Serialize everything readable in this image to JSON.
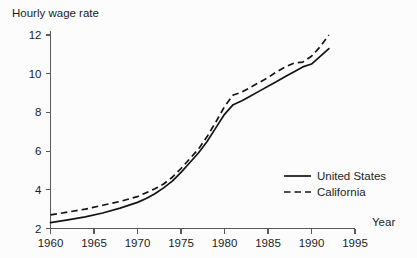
{
  "chart_data": {
    "type": "line",
    "title": "Hourly wage rate",
    "xlabel": "Year",
    "ylabel": "Hourly wage rate",
    "xlim": [
      1960,
      1995
    ],
    "ylim": [
      2,
      12
    ],
    "grid": false,
    "legend_position": "right-middle",
    "xticks": [
      1960,
      1965,
      1970,
      1975,
      1980,
      1985,
      1990,
      1995
    ],
    "yticks": [
      2,
      4,
      6,
      8,
      10,
      12
    ],
    "xtick_labels": [
      "1960",
      "1965",
      "1970",
      "1975",
      "1980",
      "1985",
      "1990",
      "1995"
    ],
    "ytick_labels": [
      "2",
      "4",
      "6",
      "8",
      "10",
      "12"
    ],
    "x": [
      1960,
      1962,
      1964,
      1966,
      1968,
      1970,
      1971,
      1972,
      1973,
      1974,
      1975,
      1976,
      1977,
      1978,
      1979,
      1980,
      1981,
      1982,
      1983,
      1984,
      1985,
      1986,
      1987,
      1988,
      1989,
      1990,
      1991,
      1992
    ],
    "series": [
      {
        "name": "United States",
        "style": "solid",
        "color": "#141414",
        "values": [
          2.3,
          2.45,
          2.6,
          2.8,
          3.05,
          3.35,
          3.55,
          3.8,
          4.1,
          4.45,
          4.9,
          5.4,
          5.9,
          6.5,
          7.2,
          7.9,
          8.4,
          8.6,
          8.85,
          9.1,
          9.35,
          9.6,
          9.85,
          10.1,
          10.35,
          10.5,
          10.9,
          11.3
        ]
      },
      {
        "name": "California",
        "style": "dashed",
        "color": "#141414",
        "values": [
          2.7,
          2.85,
          3.0,
          3.2,
          3.4,
          3.65,
          3.85,
          4.05,
          4.3,
          4.65,
          5.1,
          5.6,
          6.1,
          6.75,
          7.5,
          8.3,
          8.9,
          9.05,
          9.3,
          9.55,
          9.8,
          10.1,
          10.35,
          10.55,
          10.6,
          10.9,
          11.4,
          12.0
        ]
      }
    ]
  },
  "legend": {
    "entries": [
      {
        "label": "United States",
        "style": "solid"
      },
      {
        "label": "California",
        "style": "dashed"
      }
    ]
  }
}
